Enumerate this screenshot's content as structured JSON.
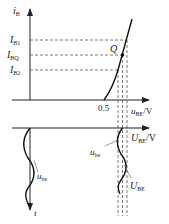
{
  "diagram": {
    "upper_plot": {
      "y_axis_label": "i",
      "y_axis_sub": "B",
      "x_axis_label": "u",
      "x_axis_sub": "BE",
      "x_axis_unit": "/V",
      "threshold_label": "0.5",
      "q_point_label": "Q",
      "current_levels": [
        {
          "main": "I",
          "sub": "B1"
        },
        {
          "main": "I",
          "sub": "BQ"
        },
        {
          "main": "I",
          "sub": "B2"
        }
      ]
    },
    "lower_plot": {
      "x_axis_label": "U",
      "x_axis_sub": "BE",
      "x_axis_unit": "/V",
      "t_axis_label": "t",
      "left_wave_label": "u",
      "left_wave_sub": "be",
      "right_wave_label": "u",
      "right_wave_sub": "be",
      "dc_label": "U",
      "dc_sub": "BE"
    },
    "colors": {
      "line": "#222222",
      "dash": "#555555",
      "background": "#ffffff"
    }
  }
}
